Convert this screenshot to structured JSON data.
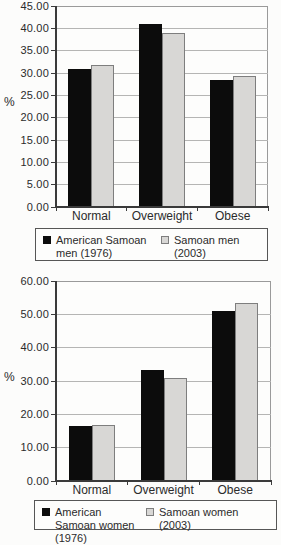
{
  "figure": {
    "description_ylabel": "%"
  },
  "chart_data": [
    {
      "id": "men",
      "type": "bar",
      "title": "",
      "xlabel": "",
      "ylabel": "%",
      "ylim": [
        0,
        45
      ],
      "ystep": 5,
      "grid": true,
      "legend_position": "bottom",
      "ytick_labels": [
        "45.00",
        "40.00",
        "35.00",
        "30.00",
        "25.00",
        "20.00",
        "15.00",
        "10.00",
        "5.00",
        "0.00"
      ],
      "categories": [
        "Normal",
        "Overweight",
        "Obese"
      ],
      "series": [
        {
          "name": "American Samoan men (1976)",
          "color": "#0c0c0c",
          "values": [
            31.0,
            41.0,
            28.4
          ]
        },
        {
          "name": "Samoan men (2003)",
          "color": "#d8d7d5",
          "border_color": "#7e7e7e",
          "values": [
            31.8,
            39.0,
            29.4
          ]
        }
      ]
    },
    {
      "id": "women",
      "type": "bar",
      "title": "",
      "xlabel": "",
      "ylabel": "%",
      "ylim": [
        0,
        60
      ],
      "ystep": 10,
      "grid": true,
      "legend_position": "bottom",
      "ytick_labels": [
        "60.00",
        "50.00",
        "40.00",
        "30.00",
        "20.00",
        "10.00",
        "0.00"
      ],
      "categories": [
        "Normal",
        "Overweight",
        "Obese"
      ],
      "series": [
        {
          "name": "American Samoan women (1976)",
          "color": "#0c0c0c",
          "values": [
            16.4,
            33.3,
            51.0
          ]
        },
        {
          "name": "Samoan women (2003)",
          "color": "#d8d7d5",
          "border_color": "#7e7e7e",
          "values": [
            16.7,
            31.0,
            53.3
          ]
        }
      ]
    }
  ]
}
